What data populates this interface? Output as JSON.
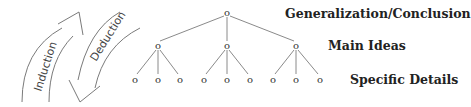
{
  "diagram": {
    "arrows": {
      "induction": {
        "label": "Induction",
        "direction": "up"
      },
      "deduction": {
        "label": "Deduction",
        "direction": "down"
      }
    },
    "levels": {
      "top": "Generalization/Conclusion",
      "middle": "Main Ideas",
      "bottom": "Specific Details"
    },
    "node_glyph": "o",
    "tree": {
      "root": {
        "x": 227,
        "y": 16
      },
      "main_ideas": [
        {
          "x": 158,
          "y": 49,
          "children": [
            135,
            158,
            180
          ]
        },
        {
          "x": 227,
          "y": 49,
          "children": [
            204,
            227,
            250
          ]
        },
        {
          "x": 296,
          "y": 49,
          "children": [
            273,
            296,
            320
          ]
        }
      ],
      "leaf_y": 82
    },
    "colors": {
      "line": "#8a8a8a",
      "text": "#222222"
    }
  }
}
